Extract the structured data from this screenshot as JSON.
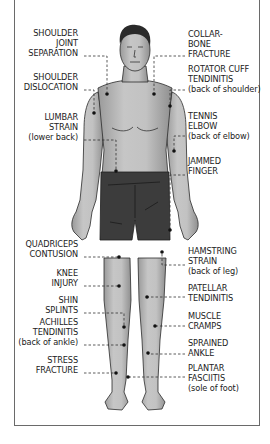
{
  "diagram": {
    "colors": {
      "skin": "#bdbdbd",
      "skin_shade": "#8e8e8e",
      "hair": "#2a2a2a",
      "shorts": "#3c3c3c",
      "outline": "#2b2b2b",
      "leader": "#333333",
      "dot": "#111111",
      "frame": "#6a6a6a"
    },
    "left_labels": [
      {
        "id": "shoulder-joint-separation",
        "lines": [
          "SHOULDER",
          "JOINT",
          "SEPARATION"
        ]
      },
      {
        "id": "shoulder-dislocation",
        "lines": [
          "SHOULDER",
          "DISLOCATION"
        ]
      },
      {
        "id": "lumbar-strain",
        "lines": [
          "LUMBAR",
          "STRAIN",
          "(lower back)"
        ]
      },
      {
        "id": "quadriceps-contusion",
        "lines": [
          "QUADRICEPS",
          "CONTUSION"
        ]
      },
      {
        "id": "knee-injury",
        "lines": [
          "KNEE",
          "INJURY"
        ]
      },
      {
        "id": "shin-splints",
        "lines": [
          "SHIN",
          "SPLINTS"
        ]
      },
      {
        "id": "achilles-tendinitis",
        "lines": [
          "ACHILLES",
          "TENDINITIS",
          "(back of ankle)"
        ]
      },
      {
        "id": "stress-fracture",
        "lines": [
          "STRESS",
          "FRACTURE"
        ]
      }
    ],
    "right_labels": [
      {
        "id": "collarbone-fracture",
        "lines": [
          "COLLAR-",
          "BONE",
          "FRACTURE"
        ]
      },
      {
        "id": "rotator-cuff-tendinitis",
        "lines": [
          "ROTATOR CUFF",
          "TENDINITIS",
          "(back of shoulder)"
        ]
      },
      {
        "id": "tennis-elbow",
        "lines": [
          "TENNIS",
          "ELBOW",
          "(back of elbow)"
        ]
      },
      {
        "id": "jammed-finger",
        "lines": [
          "JAMMED",
          "FINGER"
        ]
      },
      {
        "id": "hamstring-strain",
        "lines": [
          "HAMSTRING",
          "STRAIN",
          "(back of leg)"
        ]
      },
      {
        "id": "patellar-tendinitis",
        "lines": [
          "PATELLAR",
          "TENDINITIS"
        ]
      },
      {
        "id": "muscle-cramps",
        "lines": [
          "MUSCLE",
          "CRAMPS"
        ]
      },
      {
        "id": "sprained-ankle",
        "lines": [
          "SPRAINED",
          "ANKLE"
        ]
      },
      {
        "id": "plantar-fasciitis",
        "lines": [
          "PLANTAR",
          "FASCIITIS",
          "(sole of foot)"
        ]
      }
    ]
  }
}
